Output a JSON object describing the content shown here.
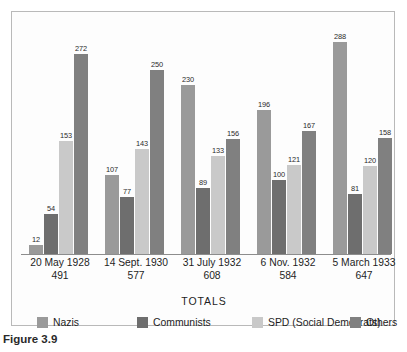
{
  "figure": {
    "caption": "Figure 3.9",
    "totals_axis_label": "TOTALS"
  },
  "colors": {
    "nazis": "#9a9a9a",
    "communists": "#6e6e6e",
    "spd": "#c9c9c9",
    "others": "#808080",
    "baseline": "#8d8d8d",
    "panel_border": "#b9b9b9",
    "text": "#1d1d1d"
  },
  "chart_data": {
    "type": "bar",
    "title": "",
    "subtitle": "",
    "xlabel": "TOTALS",
    "ylabel": "",
    "ylim": [
      0,
      300
    ],
    "grid": false,
    "legend_position": "bottom",
    "categories": [
      "20 May 1928",
      "14 Sept. 1930",
      "31 July 1932",
      "6 Nov. 1932",
      "5 March 1933"
    ],
    "category_totals": [
      491,
      577,
      608,
      584,
      647
    ],
    "series": [
      {
        "name": "Nazis",
        "values": [
          12,
          107,
          230,
          196,
          288
        ]
      },
      {
        "name": "Communists",
        "values": [
          54,
          77,
          89,
          100,
          81
        ]
      },
      {
        "name": "SPD (Social Democrats)",
        "values": [
          153,
          143,
          133,
          121,
          120
        ]
      },
      {
        "name": "Others",
        "values": [
          272,
          250,
          156,
          167,
          158
        ]
      }
    ]
  },
  "legend": {
    "items": [
      {
        "label": "Nazis",
        "swatch": "#9a9a9a"
      },
      {
        "label": "Communists",
        "swatch": "#6e6e6e"
      },
      {
        "label": "SPD (Social Democrats)",
        "swatch": "#c9c9c9"
      },
      {
        "label": "Others",
        "swatch": "#808080"
      }
    ]
  }
}
